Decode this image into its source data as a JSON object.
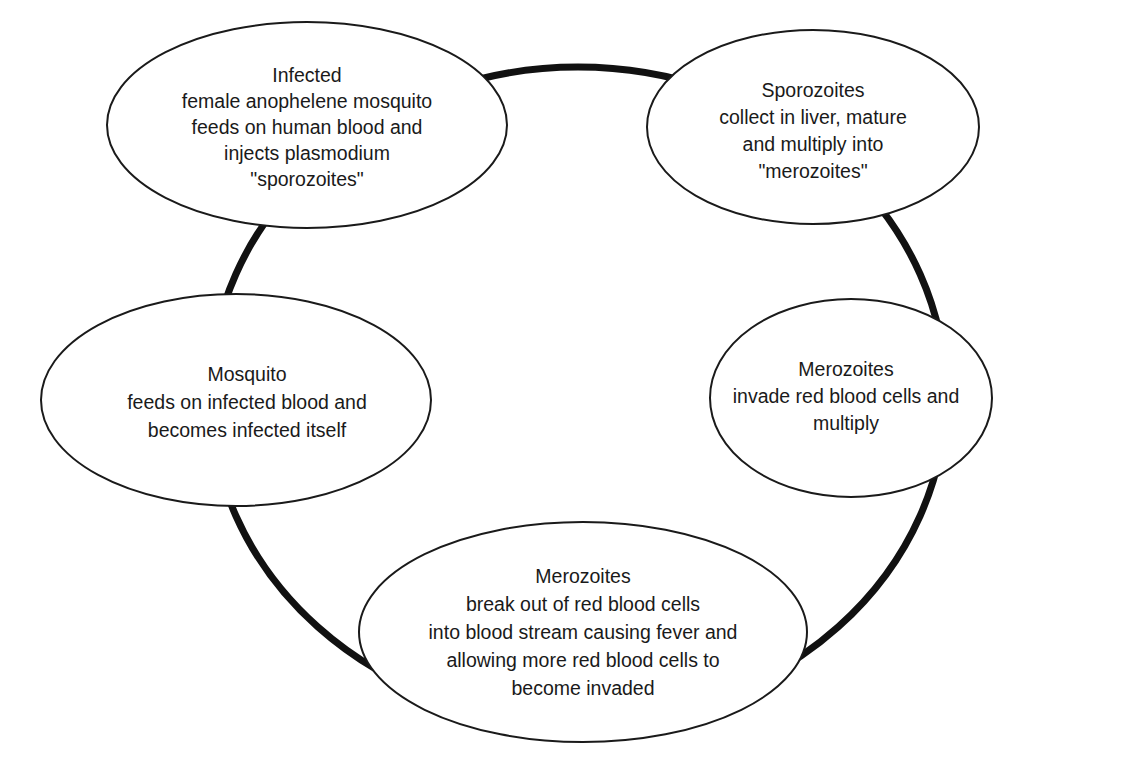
{
  "diagram": {
    "type": "cycle",
    "colors": {
      "ring": "#111111",
      "ellipse_stroke": "#1a1a1a",
      "ellipse_fill": "#ffffff",
      "text": "#1a1a1a"
    },
    "nodes": [
      {
        "id": "infected-mosquito",
        "title": "Infected",
        "lines": [
          "female anophelene mosquito",
          "feeds on human blood and",
          "injects plasmodium",
          "\"sporozoites\""
        ]
      },
      {
        "id": "sporozoites-liver",
        "title": "Sporozoites",
        "lines": [
          "collect in liver, mature",
          "and multiply into",
          "\"merozoites\""
        ]
      },
      {
        "id": "merozoites-invade",
        "title": "Merozoites",
        "lines": [
          "invade red blood cells and",
          "multiply"
        ]
      },
      {
        "id": "merozoites-break-out",
        "title": "Merozoites",
        "lines": [
          "break out of red blood cells",
          "into blood stream causing fever and",
          "allowing more red blood cells to",
          "become invaded"
        ]
      },
      {
        "id": "mosquito-feeds",
        "title": "Mosquito",
        "lines": [
          "feeds on infected blood and",
          "becomes infected itself"
        ]
      }
    ]
  }
}
